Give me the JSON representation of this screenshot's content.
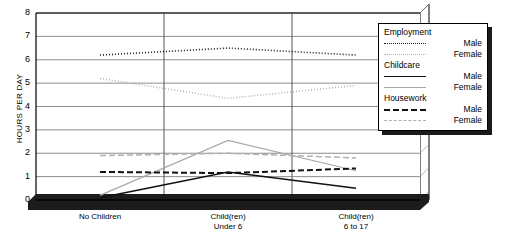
{
  "chart_data": {
    "type": "line",
    "title": "",
    "xlabel": "",
    "ylabel": "HOURS PER DAY",
    "ylim": [
      0,
      8
    ],
    "yticks": [
      "0",
      "1",
      "2",
      "3",
      "4",
      "5",
      "6",
      "7",
      "8"
    ],
    "grid": true,
    "legend_position": "top-right",
    "categories": [
      "No Children",
      "Child(ren) Under 6",
      "Child(ren) 6 to 17"
    ],
    "category_lines": [
      [
        "No Children"
      ],
      [
        "Child(ren)",
        "Under 6"
      ],
      [
        "Child(ren)",
        "6 to 17"
      ]
    ],
    "series": [
      {
        "name": "Employment Male",
        "group": "Employment",
        "sex": "Male",
        "style": "dotted",
        "color": "#1a1a1a",
        "values": [
          6.2,
          6.5,
          6.2
        ]
      },
      {
        "name": "Employment Female",
        "group": "Employment",
        "sex": "Female",
        "style": "dotted",
        "color": "#b5b5b5",
        "values": [
          5.2,
          4.35,
          4.9
        ]
      },
      {
        "name": "Childcare Male",
        "group": "Childcare",
        "sex": "Male",
        "style": "solid",
        "color": "#111111",
        "values": [
          0.1,
          1.2,
          0.5
        ]
      },
      {
        "name": "Childcare Female",
        "group": "Childcare",
        "sex": "Female",
        "style": "solid",
        "color": "#a8a8a8",
        "values": [
          0.2,
          2.55,
          1.25
        ]
      },
      {
        "name": "Housework Male",
        "group": "Housework",
        "sex": "Male",
        "style": "dashed",
        "color": "#111111",
        "values": [
          1.2,
          1.15,
          1.35
        ]
      },
      {
        "name": "Housework Female",
        "group": "Housework",
        "sex": "Female",
        "style": "dashed",
        "color": "#b0b0b0",
        "values": [
          1.9,
          2.0,
          1.8
        ]
      }
    ]
  },
  "legend": {
    "groups": [
      {
        "title": "Employment",
        "entries": [
          {
            "label": "Male"
          },
          {
            "label": "Female"
          }
        ]
      },
      {
        "title": "Childcare",
        "entries": [
          {
            "label": "Male"
          },
          {
            "label": "Female"
          }
        ]
      },
      {
        "title": "Housework",
        "entries": [
          {
            "label": "Male"
          },
          {
            "label": "Female"
          }
        ]
      }
    ]
  },
  "axes": {
    "y_title": "HOURS PER DAY",
    "y_labels": [
      "8",
      "7",
      "6",
      "5",
      "4",
      "3",
      "2",
      "1",
      "0"
    ],
    "x_labels": [
      {
        "line1": "No Children",
        "line2": ""
      },
      {
        "line1": "Child(ren)",
        "line2": "Under 6"
      },
      {
        "line1": "Child(ren)",
        "line2": "6 to 17"
      }
    ]
  },
  "colors": {
    "frame": "#000000",
    "gridline": "#808080",
    "shadow": "#1a1a1a",
    "plot_background": "#ffffff",
    "male_ink": "#111111",
    "female_ink": "#b0b0b0"
  }
}
